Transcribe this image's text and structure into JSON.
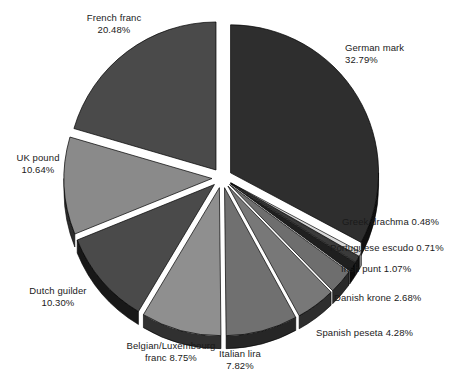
{
  "chart_data": {
    "type": "pie",
    "title": "",
    "subtitle": "",
    "xlabel": "",
    "ylabel": "",
    "legend_position": "none",
    "grid": false,
    "style": "exploded-3d-grayscale",
    "units": "percent",
    "total": 100.0,
    "categories": [
      "German mark",
      "Greek drachma",
      "Portuguese escudo",
      "Irish punt",
      "Danish krone",
      "Spanish peseta",
      "Italian lira",
      "Belgian/Luxembourg franc",
      "Dutch guilder",
      "UK pound",
      "French franc"
    ],
    "values": [
      32.79,
      0.48,
      0.71,
      1.07,
      2.68,
      4.28,
      7.82,
      8.75,
      10.3,
      10.64,
      20.48
    ],
    "slices": [
      {
        "name": "German mark",
        "value": 32.79,
        "label_name": "German mark",
        "label_value": "32.79%",
        "color": "#2e2e2e",
        "side_color": "#101010",
        "start_angle": -90,
        "end_angle": 28.04,
        "explode": 10,
        "label_x": 345,
        "label_y": 42,
        "label_align": "left",
        "label_stack": "block"
      },
      {
        "name": "Greek drachma",
        "value": 0.48,
        "label_name": "Greek drachma",
        "label_value": "0.48%",
        "color": "#d8d8d8",
        "side_color": "#8a8a8a",
        "start_angle": 28.04,
        "end_angle": 29.77,
        "explode": 10,
        "label_x": 342,
        "label_y": 216,
        "label_align": "left",
        "label_stack": "inline"
      },
      {
        "name": "Portuguese escudo",
        "value": 0.71,
        "label_name": "Portuguese escudo",
        "label_value": "0.71%",
        "color": "#3a3a3a",
        "side_color": "#141414",
        "start_angle": 29.77,
        "end_angle": 32.33,
        "explode": 10,
        "label_x": 330,
        "label_y": 242,
        "label_align": "left",
        "label_stack": "inline"
      },
      {
        "name": "Irish punt",
        "value": 1.07,
        "label_name": "Irish punt",
        "label_value": "1.07%",
        "color": "#1f1f1f",
        "side_color": "#0a0a0a",
        "start_angle": 32.33,
        "end_angle": 36.18,
        "explode": 10,
        "label_x": 341,
        "label_y": 263,
        "label_align": "left",
        "label_stack": "inline"
      },
      {
        "name": "Danish krone",
        "value": 2.68,
        "label_name": "Danish krone",
        "label_value": "2.68%",
        "color": "#6e6e6e",
        "side_color": "#2a2a2a",
        "start_angle": 36.18,
        "end_angle": 45.83,
        "explode": 10,
        "label_x": 334,
        "label_y": 292,
        "label_align": "left",
        "label_stack": "inline"
      },
      {
        "name": "Spanish peseta",
        "value": 4.28,
        "label_name": "Spanish peseta",
        "label_value": "4.28%",
        "color": "#787878",
        "side_color": "#2e2e2e",
        "start_angle": 45.83,
        "end_angle": 61.24,
        "explode": 10,
        "label_x": 316,
        "label_y": 327,
        "label_align": "left",
        "label_stack": "inline"
      },
      {
        "name": "Italian lira",
        "value": 7.82,
        "label_name": "Italian lira",
        "label_value": "7.82%",
        "color": "#707070",
        "side_color": "#262626",
        "start_angle": 61.24,
        "end_angle": 89.39,
        "explode": 10,
        "label_x": 240,
        "label_y": 348,
        "label_align": "center",
        "label_stack": "block"
      },
      {
        "name": "Belgian/Luxembourg franc",
        "value": 8.75,
        "label_name": "Belgian/Luxembourg",
        "label_value": "franc 8.75%",
        "color": "#8f8f8f",
        "side_color": "#303030",
        "start_angle": 89.39,
        "end_angle": 120.89,
        "explode": 10,
        "label_x": 171,
        "label_y": 340,
        "label_align": "center",
        "label_stack": "block"
      },
      {
        "name": "Dutch guilder",
        "value": 10.3,
        "label_name": "Dutch guilder",
        "label_value": "10.30%",
        "color": "#4a4a4a",
        "side_color": "#181818",
        "start_angle": 120.89,
        "end_angle": 157.97,
        "explode": 10,
        "label_x": 58,
        "label_y": 285,
        "label_align": "center",
        "label_stack": "block"
      },
      {
        "name": "UK pound",
        "value": 10.64,
        "label_name": "UK pound",
        "label_value": "10.64%",
        "color": "#8a8a8a",
        "side_color": "#2c2c2c",
        "start_angle": 157.97,
        "end_angle": 196.27,
        "explode": 10,
        "label_x": 38,
        "label_y": 152,
        "label_align": "center",
        "label_stack": "block"
      },
      {
        "name": "French franc",
        "value": 20.48,
        "label_name": "French franc",
        "label_value": "20.48%",
        "color": "#4a4a4a",
        "side_color": "#161616",
        "start_angle": 196.27,
        "end_angle": 270,
        "explode": 10,
        "label_x": 114,
        "label_y": 12,
        "label_align": "center",
        "label_stack": "block"
      }
    ]
  }
}
